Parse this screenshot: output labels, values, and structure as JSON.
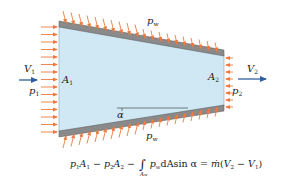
{
  "diagram": {
    "type": "converging-nozzle-control-volume",
    "colors": {
      "fluid_fill": "#cfe8f3",
      "wall_fill": "#8a8a8a",
      "wall_edge": "#555555",
      "pressure_arrows": "#f07840",
      "velocity_arrows": "#2f5fa0",
      "text": "#1a1a1a"
    },
    "labels": {
      "inlet_velocity": "V",
      "inlet_velocity_sub": "1",
      "inlet_area": "A",
      "inlet_area_sub": "1",
      "inlet_pressure": "p",
      "inlet_pressure_sub": "1",
      "outlet_velocity": "V",
      "outlet_velocity_sub": "2",
      "outlet_area": "A",
      "outlet_area_sub": "2",
      "outlet_pressure": "p",
      "outlet_pressure_sub": "2",
      "wall_pressure_top": "p",
      "wall_pressure_top_sub": "w",
      "wall_pressure_bottom": "p",
      "wall_pressure_bottom_sub": "w",
      "wall_angle": "α"
    },
    "formula": {
      "t1": "p",
      "t1s": "1",
      "t2": "A",
      "t2s": "1",
      "op1": " − ",
      "t3": "p",
      "t3s": "2",
      "t4": "A",
      "t4s": "2",
      "op2": " − ",
      "integral": "∫",
      "integral_sub": "A",
      "integral_sub2": "w",
      "t5": "p",
      "t5s": "w",
      "t6": "dA",
      "t7": "sin α",
      "eq": " = ",
      "mdot": "ṁ",
      "paren_open": "(",
      "t8": "V",
      "t8s": "2",
      "op3": " − ",
      "t9": "V",
      "t9s": "1",
      "paren_close": ")"
    }
  }
}
